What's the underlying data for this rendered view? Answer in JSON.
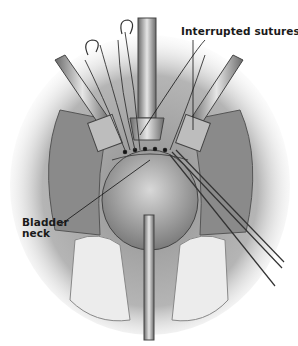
{
  "figure": {
    "style": "grayscale",
    "labels": {
      "sutures": "Interrupted sutures",
      "bladder_line1": "Bladder",
      "bladder_line2": "neck"
    },
    "colors": {
      "background": "#ffffff",
      "tissue": "#9a9a9a",
      "instrument": "#cfcfcf",
      "text": "#1a1a1a"
    }
  }
}
